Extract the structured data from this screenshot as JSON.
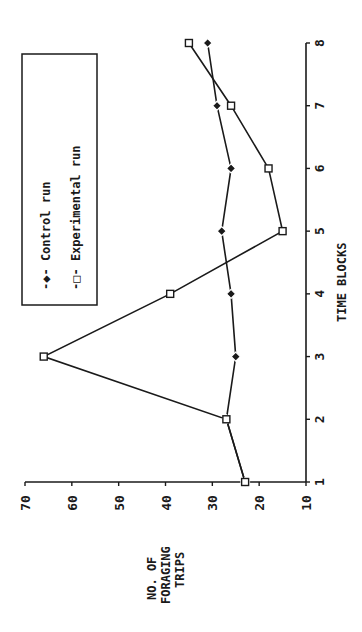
{
  "chart_data": {
    "type": "line",
    "orientation": "rotated-90-ccw",
    "title": "",
    "xlabel": "TIME BLOCKS",
    "ylabel": "NO. OF FORAGING TRIPS",
    "ylabel_lines": [
      "NO. OF",
      "FORAGING",
      "TRIPS"
    ],
    "x": [
      1,
      2,
      3,
      4,
      5,
      6,
      7,
      8
    ],
    "x_ticks": [
      "1",
      "2",
      "3",
      "4",
      "5",
      "6",
      "7",
      "8"
    ],
    "y_ticks": [
      "10",
      "20",
      "30",
      "40",
      "50",
      "60",
      "70"
    ],
    "ylim": [
      10,
      70
    ],
    "xlim": [
      1,
      8
    ],
    "grid": false,
    "legend_position": "upper-left (boxed)",
    "series": [
      {
        "name": "Control run",
        "marker": "filled-diamond",
        "legend_label": "-◆- Control run",
        "values": [
          23,
          27,
          25,
          26,
          28,
          26,
          29,
          31
        ]
      },
      {
        "name": "Experimental run",
        "marker": "open-square",
        "legend_label": "-□- Experimental run",
        "values": [
          23,
          27,
          66,
          39,
          15,
          18,
          26,
          35
        ]
      }
    ]
  },
  "colors": {
    "ink": "#1a1a1a",
    "background": "#ffffff"
  }
}
